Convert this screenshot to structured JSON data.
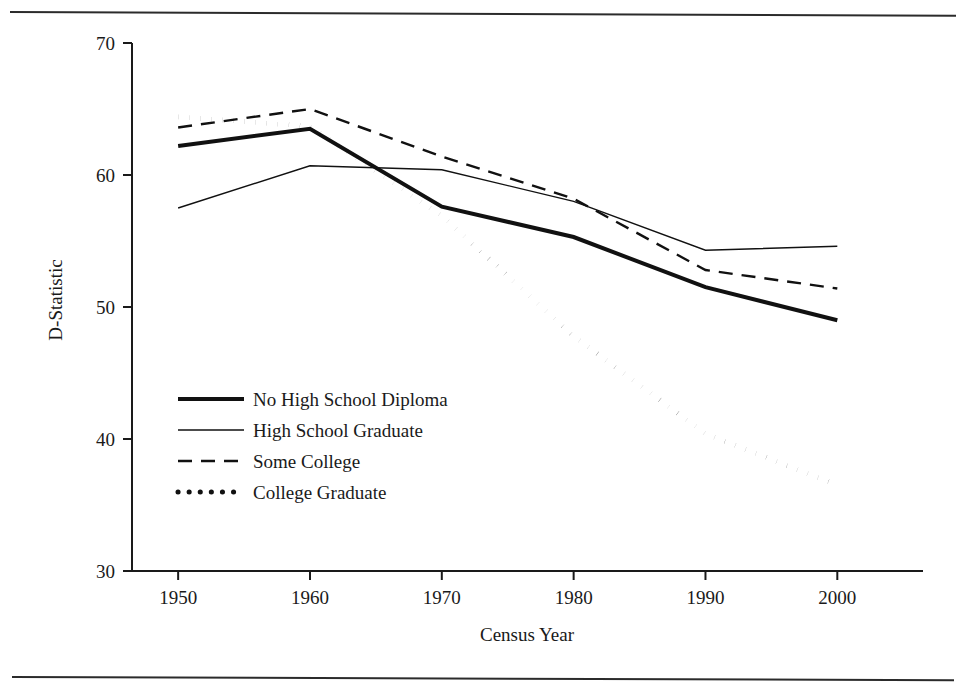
{
  "figure": {
    "caption_top": "",
    "has_top_rule": true,
    "has_bottom_rule": true
  },
  "chart_data": {
    "type": "line",
    "title": "",
    "subtitle": "",
    "xlabel": "Census Year",
    "ylabel": "D-Statistic",
    "x": [
      1950,
      1960,
      1970,
      1980,
      1990,
      2000
    ],
    "xticklabels": [
      "1950",
      "1960",
      "1970",
      "1980",
      "1990",
      "2000"
    ],
    "yticks": [
      30,
      40,
      50,
      60,
      70
    ],
    "yticklabels": [
      "30",
      "40",
      "50",
      "60",
      "70"
    ],
    "xlim": [
      1946.5,
      2006.5
    ],
    "ylim": [
      30,
      70
    ],
    "grid": false,
    "legend_position": "center-left",
    "series": [
      {
        "name": "No High School Diploma",
        "style": "thick-solid",
        "linewidth": 4,
        "dash": "none",
        "color": "#111111",
        "values": [
          62.2,
          63.5,
          57.6,
          55.3,
          51.5,
          49.0
        ]
      },
      {
        "name": "High School Graduate",
        "style": "thin-solid",
        "linewidth": 1.4,
        "dash": "none",
        "color": "#111111",
        "values": [
          57.5,
          60.7,
          60.4,
          58.0,
          54.3,
          54.6
        ]
      },
      {
        "name": "Some College",
        "style": "dashed",
        "linewidth": 2.4,
        "dash": "14,9",
        "color": "#111111",
        "values": [
          63.6,
          65.0,
          61.4,
          58.2,
          52.8,
          51.4
        ]
      },
      {
        "name": "College Graduate",
        "style": "dotted",
        "linewidth": 5,
        "dash": "0.1,11",
        "color": "#111111",
        "values": [
          64.4,
          63.7,
          56.9,
          47.8,
          40.4,
          36.5
        ]
      }
    ]
  },
  "legend": {
    "items": [
      {
        "label": "No High School Diploma",
        "swatch": "thick-solid-swatch"
      },
      {
        "label": "High School Graduate",
        "swatch": "thin-solid-swatch"
      },
      {
        "label": "Some College",
        "swatch": "dashed-swatch"
      },
      {
        "label": "College Graduate",
        "swatch": "dotted-swatch"
      }
    ]
  }
}
